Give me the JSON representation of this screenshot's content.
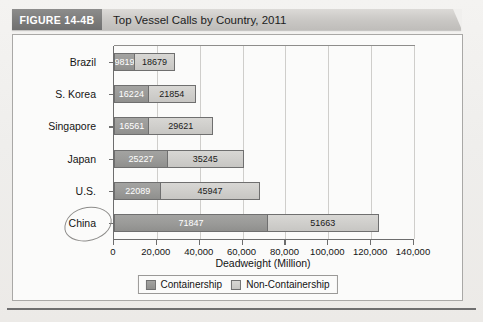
{
  "figure": {
    "tag": "FIGURE 14-4B",
    "title": "Top Vessel Calls by Country, 2011"
  },
  "chart_data": {
    "type": "bar",
    "orientation": "horizontal",
    "stacked": true,
    "title": "Top Vessel Calls by Country, 2011",
    "xlabel": "Deadweight (Million)",
    "ylabel": "",
    "xlim": [
      0,
      140000
    ],
    "xticks": [
      0,
      20000,
      40000,
      60000,
      80000,
      100000,
      120000,
      140000
    ],
    "xticklabels": [
      "0",
      "20,000",
      "40,000",
      "60,000",
      "80,000",
      "100,000",
      "120,000",
      "140,000"
    ],
    "grid": true,
    "grid_axis": "x",
    "legend_position": "bottom",
    "categories": [
      "Brazil",
      "S. Korea",
      "Singapore",
      "Japan",
      "U.S.",
      "China"
    ],
    "highlighted_category": "China",
    "series": [
      {
        "name": "Containership",
        "color": "#9a9a98",
        "values": [
          9819,
          16224,
          16561,
          25227,
          22089,
          71847
        ]
      },
      {
        "name": "Non-Containership",
        "color": "#cfcecb",
        "values": [
          18679,
          21854,
          29621,
          35245,
          45947,
          51663
        ]
      }
    ],
    "value_labels": {
      "Brazil": [
        "9819",
        "18679"
      ],
      "S. Korea": [
        "16224",
        "21854"
      ],
      "Singapore": [
        "16561",
        "29621"
      ],
      "Japan": [
        "25227",
        "35245"
      ],
      "U.S.": [
        "22089",
        "45947"
      ],
      "China": [
        "71847",
        "51663"
      ]
    }
  },
  "legend": {
    "items": [
      {
        "label": "Containership"
      },
      {
        "label": "Non-Containership"
      }
    ]
  },
  "colors": {
    "series_a": "#9a9a98",
    "series_b": "#cfcecb",
    "axis": "#6d6d6d",
    "grid": "#cfcecb",
    "header_band": "#c9c7c4",
    "header_tag": "#7c7c7b"
  }
}
